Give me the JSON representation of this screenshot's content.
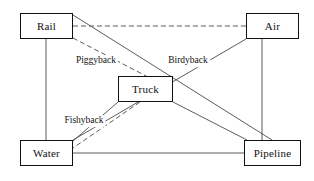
{
  "diagram": {
    "type": "network-diagram",
    "background_color": "#ffffff",
    "line_color": "#4a4a4a",
    "node_border_color": "#111111",
    "nodes": [
      {
        "id": "rail",
        "label": "Rail",
        "x": 20,
        "y": 13,
        "w": 53,
        "h": 26
      },
      {
        "id": "air",
        "label": "Air",
        "x": 246,
        "y": 13,
        "w": 53,
        "h": 26
      },
      {
        "id": "truck",
        "label": "Truck",
        "x": 118,
        "y": 76,
        "w": 55,
        "h": 26
      },
      {
        "id": "water",
        "label": "Water",
        "x": 20,
        "y": 140,
        "w": 53,
        "h": 26
      },
      {
        "id": "pipeline",
        "label": "Pipeline",
        "x": 244,
        "y": 140,
        "w": 57,
        "h": 26
      }
    ],
    "edge_labels": [
      {
        "id": "piggyback",
        "label": "Piggyback",
        "x": 96,
        "y": 61
      },
      {
        "id": "birdyback",
        "label": "Birdyback",
        "x": 188,
        "y": 61
      },
      {
        "id": "fishyback",
        "label": "Fishyback",
        "x": 84,
        "y": 121
      }
    ],
    "edges": [
      {
        "id": "rail-water",
        "from": "Rail",
        "to": "Water",
        "style": "solid",
        "x1": 46,
        "y1": 39,
        "x2": 46,
        "y2": 140
      },
      {
        "id": "rail-air",
        "from": "Rail",
        "to": "Air",
        "style": "dashed",
        "x1": 73,
        "y1": 26,
        "x2": 246,
        "y2": 26
      },
      {
        "id": "rail-pipeline",
        "from": "Rail",
        "to": "Pipeline",
        "style": "solid",
        "x1": 73,
        "y1": 15,
        "x2": 272,
        "y2": 140
      },
      {
        "id": "rail-truck",
        "from": "Rail",
        "to": "Truck",
        "style": "dashed",
        "x1": 73,
        "y1": 38,
        "x2": 173,
        "y2": 90
      },
      {
        "id": "air-water",
        "from": "Air",
        "to": "Water",
        "style": "solid",
        "x1": 246,
        "y1": 39,
        "x2": 73,
        "y2": 140
      },
      {
        "id": "air-pipeline",
        "from": "Air",
        "to": "Pipeline",
        "style": "solid",
        "x1": 262,
        "y1": 39,
        "x2": 262,
        "y2": 140
      },
      {
        "id": "truck-water",
        "from": "Truck",
        "to": "Water",
        "style": "solid",
        "x1": 118,
        "y1": 102,
        "x2": 73,
        "y2": 141
      },
      {
        "id": "truck-water-2",
        "from": "Truck",
        "to": "Water",
        "style": "dashed",
        "x1": 140,
        "y1": 102,
        "x2": 73,
        "y2": 148
      },
      {
        "id": "truck-pipeline",
        "from": "Truck",
        "to": "Pipeline",
        "style": "solid",
        "x1": 173,
        "y1": 102,
        "x2": 247,
        "y2": 140
      },
      {
        "id": "water-pipeline",
        "from": "Water",
        "to": "Pipeline",
        "style": "solid",
        "x1": 73,
        "y1": 153,
        "x2": 244,
        "y2": 153
      }
    ]
  }
}
